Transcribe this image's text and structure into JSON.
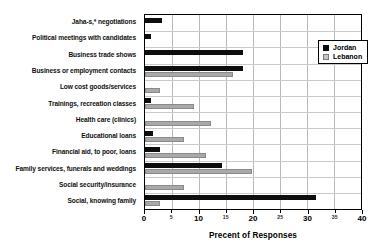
{
  "chart_data": {
    "type": "bar",
    "orientation": "horizontal",
    "title": "",
    "xlabel": "Precent of Responses",
    "ylabel": "",
    "xlim": [
      0,
      40
    ],
    "major_ticks": [
      0,
      10,
      20,
      30,
      40
    ],
    "minor_ticks": [
      5,
      15,
      25,
      35
    ],
    "grid": true,
    "grid_axis": "x",
    "legend_position": "top-right",
    "categories": [
      "Jaha-s,* negotiations",
      "Political meetings with candidates",
      "Business trade shows",
      "Business or employment contacts",
      "Low cost goods/services",
      "Trainings, recreation classes",
      "Health care (clinics)",
      "Educational loans",
      "Financial aid, to poor, loans",
      "Family services, funerals and weddings",
      "Social security/insurance",
      "Social, knowing family"
    ],
    "series": [
      {
        "name": "Jordan",
        "color": "#0d0d0d",
        "values": [
          3.1,
          1.2,
          18.1,
          18.1,
          0.0,
          1.2,
          0.0,
          1.4,
          2.7,
          14.3,
          0.0,
          31.7
        ]
      },
      {
        "name": "Lebanon",
        "color": "#a9a9a9",
        "values": [
          0.0,
          0.0,
          0.0,
          16.3,
          2.7,
          9.0,
          12.3,
          7.3,
          11.3,
          19.8,
          7.3,
          2.7
        ]
      }
    ]
  },
  "axis": {
    "tick_labels": [
      "0",
      "5",
      "10",
      "15",
      "20",
      "25",
      "30",
      "35",
      "40"
    ]
  },
  "legend": {
    "items": [
      {
        "label": "Jordan"
      },
      {
        "label": "Lebanon"
      }
    ]
  }
}
